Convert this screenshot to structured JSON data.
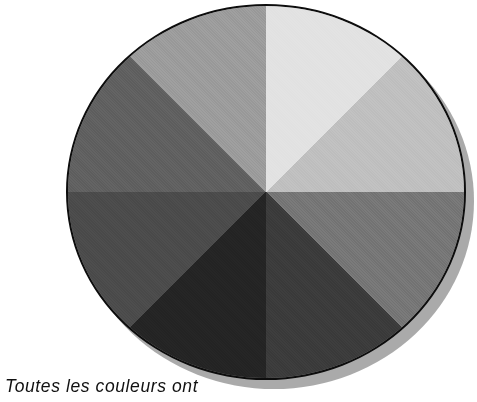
{
  "figure": {
    "name": "grayscale-color-wheel",
    "caption": "Toutes les couleurs ont",
    "background_color": "#ffffff",
    "outline_color": "#0d0d0d",
    "shadow_color": "#9c9c9c",
    "center": {
      "x": 266,
      "y": 190
    },
    "radius_x": 200,
    "radius_y": 188
  },
  "chart_data": {
    "type": "pie",
    "title": "",
    "subtitle": "",
    "xlabel": "",
    "ylabel": "",
    "legend_position": "none",
    "grid": false,
    "note": "Eight equal 45-degree grayscale sectors of a colour wheel reproduced in halftone black-and-white. Sector boundaries lie on the vertical axis, the horizontal axis and the two diagonals.",
    "categories": [
      "north-northeast",
      "east-northeast",
      "east-southeast",
      "south-southeast",
      "south-southwest",
      "west-southwest",
      "west-northwest",
      "north-northwest"
    ],
    "values": [
      12.5,
      12.5,
      12.5,
      12.5,
      12.5,
      12.5,
      12.5,
      12.5
    ],
    "slice_angles_deg": [
      45,
      45,
      45,
      45,
      45,
      45,
      45,
      45
    ],
    "start_angle_deg": 0,
    "colors": [
      "#e2e2e2",
      "#bfbfbf",
      "#767676",
      "#3b3b3b",
      "#242424",
      "#4b4b4b",
      "#606060",
      "#9c9c9c"
    ],
    "series": [
      {
        "name": "sector gray level",
        "values": [
          226,
          191,
          118,
          59,
          36,
          75,
          96,
          156
        ]
      }
    ]
  },
  "sectors": [
    {
      "label": "north-northeast",
      "color": "#e2e2e2",
      "from_deg": 0,
      "to_deg": 45
    },
    {
      "label": "east-northeast",
      "color": "#bfbfbf",
      "from_deg": 45,
      "to_deg": 90
    },
    {
      "label": "east-southeast",
      "color": "#767676",
      "from_deg": 90,
      "to_deg": 135
    },
    {
      "label": "south-southeast",
      "color": "#3b3b3b",
      "from_deg": 135,
      "to_deg": 180
    },
    {
      "label": "south-southwest",
      "color": "#242424",
      "from_deg": 180,
      "to_deg": 225
    },
    {
      "label": "west-southwest",
      "color": "#4b4b4b",
      "from_deg": 225,
      "to_deg": 270
    },
    {
      "label": "west-northwest",
      "color": "#606060",
      "from_deg": 270,
      "to_deg": 315
    },
    {
      "label": "north-northwest",
      "color": "#9c9c9c",
      "from_deg": 315,
      "to_deg": 360
    }
  ]
}
